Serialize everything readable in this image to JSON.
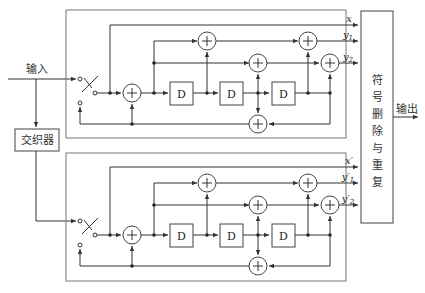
{
  "diagram": {
    "type": "turbo-encoder-block-diagram",
    "input_label": "输入",
    "output_label": "输出",
    "interleaver_label": "交织器",
    "puncture_block_label": [
      "符",
      "号",
      "删",
      "除",
      "与",
      "重",
      "复"
    ],
    "delay_label": "D",
    "adder_symbol": "+",
    "encoder1": {
      "outputs": [
        {
          "label": "x",
          "sub": ""
        },
        {
          "label": "y",
          "sub": "1"
        },
        {
          "label": "y",
          "sub": "2"
        }
      ]
    },
    "encoder2": {
      "outputs": [
        {
          "label": "x′",
          "sub": ""
        },
        {
          "label": "y′",
          "sub": "1"
        },
        {
          "label": "y′",
          "sub": "2"
        }
      ]
    }
  }
}
